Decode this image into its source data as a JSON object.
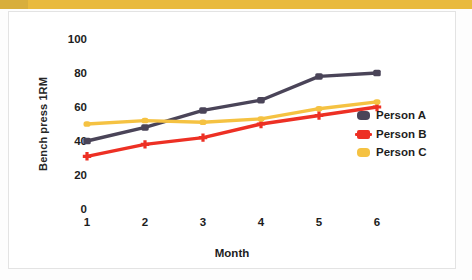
{
  "figure": {
    "top_band_color": "#e9ba3e",
    "background": "#ffffff",
    "border_color": "#e3e3e3"
  },
  "axes": {
    "y_title": "Bench press 1RM",
    "x_title": "Month",
    "y_ticks": [
      "0",
      "20",
      "40",
      "60",
      "80",
      "100"
    ],
    "x_ticks": [
      "1",
      "2",
      "3",
      "4",
      "5",
      "6"
    ]
  },
  "legend": {
    "position": "right",
    "items": [
      {
        "label": "Person A",
        "color": "#4a4458"
      },
      {
        "label": "Person B",
        "color": "#ed3024"
      },
      {
        "label": "Person C",
        "color": "#f5c242"
      }
    ]
  },
  "chart_data": {
    "type": "line",
    "title": "",
    "xlabel": "Month",
    "ylabel": "Bench press 1RM",
    "categories": [
      "1",
      "2",
      "3",
      "4",
      "5",
      "6"
    ],
    "x": [
      1,
      2,
      3,
      4,
      5,
      6
    ],
    "xlim": [
      1,
      6
    ],
    "ylim": [
      0,
      100
    ],
    "ytick_step": 20,
    "grid": false,
    "legend_position": "right",
    "series": [
      {
        "name": "Person A",
        "color": "#4a4458",
        "values": [
          40,
          48,
          58,
          64,
          78,
          80
        ]
      },
      {
        "name": "Person B",
        "color": "#ed3024",
        "values": [
          31,
          38,
          42,
          50,
          55,
          60
        ]
      },
      {
        "name": "Person C",
        "color": "#f5c242",
        "values": [
          50,
          52,
          51,
          53,
          59,
          63
        ]
      }
    ]
  }
}
